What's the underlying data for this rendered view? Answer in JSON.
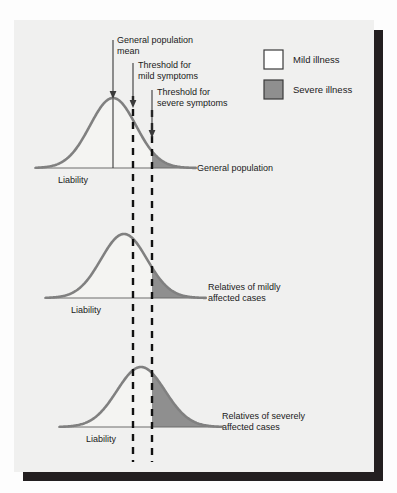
{
  "figure": {
    "background_color": "#f0f0ef",
    "page_color": "#fdfdfd",
    "shadow_color": "#231f20",
    "curve_color": "#808080",
    "baseline_color": "#6d6d6d",
    "mild_fill": "#f4f4f2",
    "severe_fill": "#8f8f8f",
    "threshold_line_color": "#111111",
    "mean_line_color": "#3a3a3a"
  },
  "legend": {
    "items": [
      {
        "label": "Mild illness",
        "swatch": "#ffffff",
        "border": "#3a3a3a",
        "icon": "square-swatch-icon"
      },
      {
        "label": "Severe illness",
        "swatch": "#8f8f8f",
        "border": "#3a3a3a",
        "icon": "square-swatch-icon"
      }
    ]
  },
  "annotations": [
    {
      "id": "general-population-mean",
      "line1": "General population",
      "line2": "mean",
      "icon": "down-arrow-icon"
    },
    {
      "id": "threshold-mild",
      "line1": "Threshold for",
      "line2": "mild symptoms",
      "icon": "down-arrow-icon"
    },
    {
      "id": "threshold-severe",
      "line1": "Threshold for",
      "line2": "severe symptoms",
      "icon": "down-arrow-icon"
    }
  ],
  "panels": [
    {
      "id": "general-population",
      "title_line1": "General population",
      "title_line2": "",
      "axis_label": "Liability",
      "baseline_y": 168,
      "peak_x": 113,
      "peak_height": 70,
      "sigma": 23,
      "x_start": 36,
      "x_end": 196
    },
    {
      "id": "relatives-of-mildly-affected-cases",
      "title_line1": "Relatives of mildly",
      "title_line2": "affected cases",
      "axis_label": "Liability",
      "baseline_y": 298,
      "peak_x": 124,
      "peak_height": 64,
      "sigma": 23,
      "x_start": 46,
      "x_end": 206
    },
    {
      "id": "relatives-of-severely-affected-cases",
      "title_line1": "Relatives of severely",
      "title_line2": "affected cases",
      "axis_label": "Liability",
      "baseline_y": 427,
      "peak_x": 141,
      "peak_height": 60,
      "sigma": 24,
      "x_start": 60,
      "x_end": 222
    }
  ],
  "thresholds": {
    "mild_x": 133,
    "severe_x": 152,
    "mean_x": 113,
    "dash_top": 96,
    "dash_bottom": 462
  },
  "chart_data": {
    "type": "line",
    "xlabel": "Liability",
    "ylabel": "",
    "grid": false,
    "legend_position": "top-right",
    "legend": [
      "Mild illness",
      "Severe illness"
    ],
    "annotations": [
      "General population mean",
      "Threshold for mild symptoms",
      "Threshold for severe symptoms"
    ],
    "thresholds": {
      "mild": 133,
      "severe": 152,
      "general_population_mean": 113
    },
    "series": [
      {
        "name": "General population",
        "mean": 113,
        "sd": 23,
        "peak_height": 70,
        "baseline_y": 168
      },
      {
        "name": "Relatives of mildly affected cases",
        "mean": 124,
        "sd": 23,
        "peak_height": 64,
        "baseline_y": 298
      },
      {
        "name": "Relatives of severely affected cases",
        "mean": 141,
        "sd": 24,
        "peak_height": 60,
        "baseline_y": 427
      }
    ]
  }
}
